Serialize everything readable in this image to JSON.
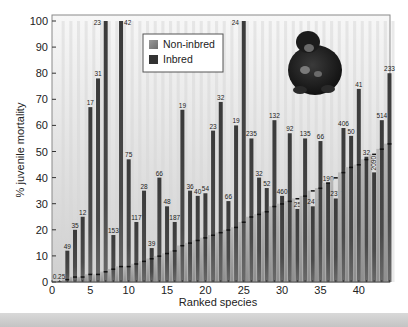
{
  "chart_data": {
    "type": "bar",
    "title": "",
    "xlabel": "Ranked species",
    "ylabel": "% juvenile mortality",
    "xlim": [
      0,
      44
    ],
    "ylim": [
      0,
      100
    ],
    "xticks": [
      0,
      5,
      10,
      15,
      20,
      25,
      30,
      35,
      40
    ],
    "yticks": [
      0,
      10,
      20,
      30,
      40,
      50,
      60,
      70,
      80,
      90,
      100
    ],
    "grid": false,
    "legend": {
      "position": "upper-center",
      "entries": [
        {
          "label": "Non-inbred",
          "color": "#8a8a8a"
        },
        {
          "label": "Inbred",
          "color": "#3b3b3b"
        }
      ]
    },
    "annotation_image": "chimpanzee-illustration",
    "categories": [
      1,
      2,
      3,
      4,
      5,
      6,
      7,
      8,
      9,
      10,
      11,
      12,
      13,
      14,
      15,
      16,
      17,
      18,
      19,
      20,
      21,
      22,
      23,
      24,
      25,
      26,
      27,
      28,
      29,
      30,
      31,
      32,
      33,
      34,
      35,
      36,
      37,
      38,
      39,
      40,
      41,
      42,
      43,
      44
    ],
    "series": [
      {
        "name": "Inbred",
        "values": [
          0,
          12,
          20,
          25,
          67,
          78,
          100,
          18,
          100,
          47,
          23,
          35,
          13,
          40,
          29,
          23,
          66,
          35,
          33,
          34,
          58,
          69,
          31,
          60,
          100,
          55,
          40,
          36,
          62,
          33,
          57,
          28,
          55,
          29,
          54,
          38,
          32,
          59,
          56,
          74,
          48,
          42,
          62,
          80
        ]
      },
      {
        "name": "Non-inbred",
        "values": [
          0,
          1,
          2,
          2,
          3,
          3,
          4,
          5,
          6,
          6,
          7,
          8,
          9,
          10,
          11,
          12,
          14,
          15,
          16,
          17,
          18,
          19,
          20,
          21,
          23,
          25,
          26,
          27,
          29,
          30,
          31,
          32,
          33,
          35,
          36,
          38,
          40,
          42,
          44,
          45,
          47,
          49,
          51,
          53
        ]
      }
    ],
    "bar_labels": [
      "0.25",
      "49",
      "35",
      "12",
      "17",
      "31",
      "23",
      "153",
      "42",
      "75",
      "117",
      "28",
      "39",
      "66",
      "48",
      "187",
      "19",
      "36",
      "40",
      "54",
      "23",
      "32",
      "66",
      "19",
      "24",
      "235",
      "32",
      "52",
      "132",
      "460",
      "92",
      "25",
      "135",
      "247",
      "66",
      "190",
      "237",
      "406",
      "50",
      "41",
      "32",
      "2090",
      "514",
      "233"
    ]
  }
}
